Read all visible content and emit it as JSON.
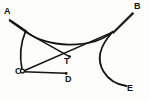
{
  "figure": {
    "background_color": "#fdfdfc",
    "ink_color": "#141414",
    "labels": [
      {
        "id": "A",
        "text": "A",
        "x": 8,
        "y": 12
      },
      {
        "id": "B",
        "text": "B",
        "x": 138,
        "y": 7
      },
      {
        "id": "C",
        "text": "C",
        "x": 19,
        "y": 72
      },
      {
        "id": "D",
        "text": "D",
        "x": 69,
        "y": 80
      },
      {
        "id": "E",
        "text": "E",
        "x": 131,
        "y": 89
      },
      {
        "id": "T",
        "text": "T",
        "x": 68,
        "y": 62
      }
    ],
    "points": {
      "A": {
        "x": 10,
        "y": 20
      },
      "B": {
        "x": 133,
        "y": 13
      },
      "C": {
        "x": 24,
        "y": 72
      },
      "D": {
        "x": 66,
        "y": 73
      },
      "E": {
        "x": 127,
        "y": 86
      },
      "T": {
        "x": 69,
        "y": 56
      },
      "cusp_left": {
        "x": 25,
        "y": 30
      },
      "cusp_right": {
        "x": 113,
        "y": 31
      }
    },
    "curves": [
      {
        "name": "tangent-A-to-left-cusp",
        "type": "line",
        "from": "A",
        "to": "cusp_left"
      },
      {
        "name": "tangent-right-cusp-to-B",
        "type": "line",
        "from": "cusp_right",
        "to": "B"
      },
      {
        "name": "caustic-upper-arc",
        "type": "quadratic",
        "from": "cusp_left",
        "to": "cusp_right",
        "sag": 45
      },
      {
        "name": "caustic-left-branch-to-C",
        "type": "quadratic",
        "from": "cusp_left",
        "to": "C",
        "bulge": "left"
      },
      {
        "name": "caustic-right-branch-to-E",
        "type": "cubic",
        "from": "cusp_right",
        "to": "E",
        "bulge": "right"
      },
      {
        "name": "ray-left-cusp-to-T",
        "type": "line",
        "from": "cusp_left",
        "to": "T"
      },
      {
        "name": "ray-C-to-right-cusp",
        "type": "line",
        "from": "C",
        "to": "cusp_right"
      },
      {
        "name": "ray-C-to-D",
        "type": "line",
        "from": "C",
        "to": "D"
      },
      {
        "name": "ray-A-secondary",
        "type": "line",
        "from": "A",
        "to": "cusp_left_inner"
      }
    ],
    "point_markers": [
      "C",
      "D",
      "T"
    ]
  }
}
